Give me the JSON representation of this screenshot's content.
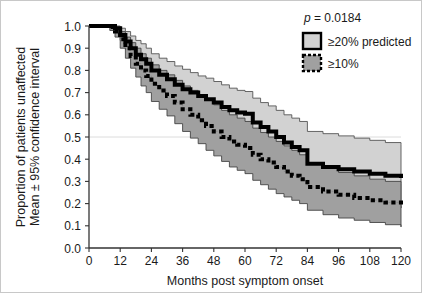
{
  "chart_data": {
    "type": "line",
    "title": "",
    "xlabel": "Months post symptom onset",
    "ylabel_line1": "Proportion of patients unaffected",
    "ylabel_line2": "Mean ± 95% confidence interval",
    "xlim": [
      0,
      120
    ],
    "ylim": [
      0.0,
      1.0
    ],
    "xticks": [
      0,
      12,
      24,
      36,
      48,
      60,
      72,
      84,
      96,
      108,
      120
    ],
    "xtick_labels": [
      "0",
      "12",
      "24",
      "36",
      "48",
      "60",
      "72",
      "84",
      "96",
      "108",
      "120"
    ],
    "yticks": [
      0.0,
      0.1,
      0.2,
      0.3,
      0.4,
      0.5,
      0.6,
      0.7,
      0.8,
      0.9,
      1.0
    ],
    "ytick_labels": [
      "0.0",
      "0.1",
      "0.2",
      "0.3",
      "0.4",
      "0.5",
      "0.6",
      "0.7",
      "0.8",
      "0.9",
      "1.0"
    ],
    "gridlines": [
      0.5
    ],
    "grid": "horizontal-0.5-only",
    "legend_position": "top-right",
    "annotations": [
      {
        "name": "p-value",
        "text_italic": "p",
        "text": " = 0.0184"
      }
    ],
    "series": [
      {
        "name": "≥20% predicted",
        "style": "solid",
        "line_color": "#000000",
        "line_width": 4,
        "band_color": "#d2d2d2",
        "band_edge_color": "#555555",
        "x": [
          0,
          4,
          8,
          10,
          12,
          14,
          16,
          18,
          20,
          22,
          24,
          27,
          30,
          33,
          36,
          39,
          42,
          45,
          48,
          51,
          54,
          57,
          60,
          63,
          66,
          69,
          72,
          75,
          78,
          81,
          84,
          90,
          96,
          102,
          108,
          114,
          120
        ],
        "y": [
          1.0,
          1.0,
          1.0,
          0.99,
          0.96,
          0.93,
          0.9,
          0.87,
          0.85,
          0.83,
          0.8,
          0.78,
          0.76,
          0.735,
          0.715,
          0.7,
          0.685,
          0.67,
          0.655,
          0.635,
          0.62,
          0.61,
          0.605,
          0.565,
          0.545,
          0.525,
          0.5,
          0.475,
          0.455,
          0.44,
          0.38,
          0.365,
          0.355,
          0.345,
          0.335,
          0.325,
          0.315
        ],
        "y_upper": [
          1.0,
          1.0,
          1.0,
          1.0,
          0.99,
          0.975,
          0.955,
          0.935,
          0.92,
          0.9,
          0.875,
          0.855,
          0.84,
          0.82,
          0.805,
          0.79,
          0.775,
          0.765,
          0.75,
          0.735,
          0.72,
          0.71,
          0.705,
          0.675,
          0.655,
          0.64,
          0.62,
          0.6,
          0.585,
          0.57,
          0.525,
          0.515,
          0.505,
          0.495,
          0.485,
          0.475,
          0.465
        ],
        "y_lower": [
          1.0,
          1.0,
          1.0,
          0.975,
          0.935,
          0.895,
          0.855,
          0.82,
          0.79,
          0.765,
          0.73,
          0.705,
          0.68,
          0.655,
          0.63,
          0.61,
          0.595,
          0.58,
          0.56,
          0.54,
          0.52,
          0.51,
          0.505,
          0.46,
          0.44,
          0.415,
          0.39,
          0.36,
          0.335,
          0.315,
          0.25,
          0.235,
          0.22,
          0.21,
          0.2,
          0.19,
          0.18
        ]
      },
      {
        "name": "≥10%",
        "style": "dotted",
        "line_color": "#000000",
        "line_width": 4,
        "band_color": "#a0a0a0",
        "band_edge_color": "#444444",
        "x": [
          0,
          4,
          8,
          10,
          12,
          14,
          16,
          18,
          20,
          22,
          24,
          27,
          30,
          33,
          36,
          39,
          42,
          45,
          48,
          51,
          54,
          57,
          60,
          63,
          66,
          69,
          72,
          75,
          78,
          81,
          84,
          90,
          96,
          102,
          108,
          114,
          120
        ],
        "y": [
          1.0,
          1.0,
          0.995,
          0.975,
          0.94,
          0.9,
          0.865,
          0.83,
          0.8,
          0.775,
          0.74,
          0.71,
          0.685,
          0.655,
          0.625,
          0.6,
          0.575,
          0.55,
          0.525,
          0.5,
          0.48,
          0.465,
          0.45,
          0.42,
          0.4,
          0.385,
          0.365,
          0.345,
          0.325,
          0.31,
          0.275,
          0.255,
          0.24,
          0.225,
          0.215,
          0.205,
          0.195
        ],
        "y_upper": [
          1.0,
          1.0,
          1.0,
          0.995,
          0.975,
          0.95,
          0.925,
          0.9,
          0.875,
          0.855,
          0.825,
          0.8,
          0.78,
          0.755,
          0.73,
          0.71,
          0.69,
          0.665,
          0.645,
          0.62,
          0.6,
          0.585,
          0.57,
          0.54,
          0.52,
          0.5,
          0.48,
          0.46,
          0.44,
          0.42,
          0.385,
          0.36,
          0.34,
          0.325,
          0.31,
          0.3,
          0.29
        ],
        "y_lower": [
          1.0,
          1.0,
          0.98,
          0.95,
          0.9,
          0.855,
          0.81,
          0.77,
          0.73,
          0.7,
          0.66,
          0.625,
          0.595,
          0.56,
          0.525,
          0.495,
          0.47,
          0.44,
          0.415,
          0.39,
          0.365,
          0.35,
          0.335,
          0.305,
          0.285,
          0.265,
          0.245,
          0.23,
          0.215,
          0.2,
          0.17,
          0.15,
          0.135,
          0.125,
          0.115,
          0.105,
          0.095
        ]
      }
    ]
  },
  "legend": {
    "pvalue_symbol": "p",
    "pvalue_text": " = 0.0184",
    "items": [
      {
        "label": "≥20% predicted",
        "swatch": "light-gray-solid-border"
      },
      {
        "label": "≥10%",
        "swatch": "dark-gray-dotted-border"
      }
    ]
  },
  "colors": {
    "band_light": "#d2d2d2",
    "band_dark": "#a0a0a0",
    "line": "#000000",
    "axis": "#333333",
    "gridline": "#dcdcdc",
    "background": "#ffffff",
    "frame": "#c8c8c8"
  }
}
